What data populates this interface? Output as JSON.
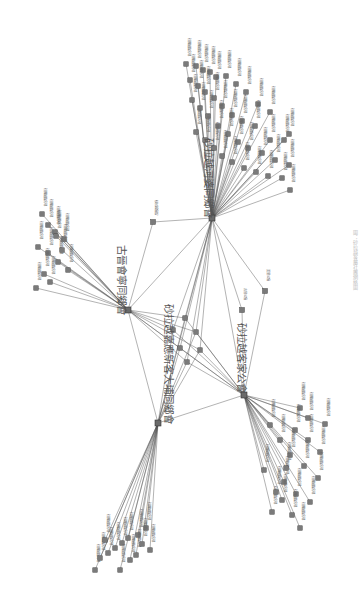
{
  "diagram": {
    "type": "network",
    "orientation": "rotated-90-clockwise",
    "caption": "圖：砂拉越客屬社團網絡圖",
    "hubs": [
      {
        "id": "h1",
        "label": "古晉會寧同鄉會",
        "x": 128,
        "y": 310,
        "label_x": 118,
        "label_y": 318
      },
      {
        "id": "h2",
        "label": "砂拉越河婆同鄉會",
        "x": 212,
        "y": 218,
        "label_x": 205,
        "label_y": 222
      },
      {
        "id": "h3",
        "label": "砂拉越客家公會",
        "x": 244,
        "y": 395,
        "label_x": 238,
        "label_y": 396
      },
      {
        "id": "h4",
        "label": "砂拉越嘉應新客大埔同鄉會",
        "x": 158,
        "y": 423,
        "label_x": 165,
        "label_y": 430
      }
    ],
    "center_nodes": [
      {
        "x": 185,
        "y": 318
      },
      {
        "x": 173,
        "y": 330
      },
      {
        "x": 196,
        "y": 332
      },
      {
        "x": 180,
        "y": 348
      },
      {
        "x": 200,
        "y": 350
      },
      {
        "x": 187,
        "y": 362
      }
    ],
    "bridge_nodes": [
      {
        "x": 153,
        "y": 222,
        "label": "砂拉越會館"
      },
      {
        "x": 242,
        "y": 310,
        "label": "古晉公會"
      },
      {
        "x": 265,
        "y": 291,
        "label": "美里公會"
      }
    ],
    "clusters": {
      "h2": [
        [
          186,
          64
        ],
        [
          196,
          66
        ],
        [
          203,
          70
        ],
        [
          210,
          72
        ],
        [
          216,
          77
        ],
        [
          226,
          76
        ],
        [
          236,
          84
        ],
        [
          246,
          92
        ],
        [
          258,
          104
        ],
        [
          270,
          112
        ],
        [
          289,
          134
        ],
        [
          190,
          80
        ],
        [
          198,
          86
        ],
        [
          205,
          92
        ],
        [
          214,
          98
        ],
        [
          222,
          106
        ],
        [
          232,
          115
        ],
        [
          242,
          121
        ],
        [
          255,
          126
        ],
        [
          270,
          140
        ],
        [
          284,
          140
        ],
        [
          192,
          100
        ],
        [
          200,
          108
        ],
        [
          208,
          116
        ],
        [
          218,
          126
        ],
        [
          228,
          134
        ],
        [
          238,
          142
        ],
        [
          248,
          148
        ],
        [
          262,
          153
        ],
        [
          275,
          160
        ],
        [
          289,
          165
        ],
        [
          196,
          132
        ],
        [
          205,
          140
        ],
        [
          214,
          148
        ],
        [
          222,
          156
        ],
        [
          232,
          162
        ],
        [
          244,
          168
        ],
        [
          256,
          172
        ],
        [
          268,
          176
        ],
        [
          282,
          178
        ],
        [
          290,
          190
        ]
      ],
      "h1": [
        [
          42,
          214
        ],
        [
          48,
          225
        ],
        [
          55,
          232
        ],
        [
          64,
          239
        ],
        [
          38,
          247
        ],
        [
          48,
          253
        ],
        [
          58,
          262
        ],
        [
          68,
          270
        ],
        [
          44,
          274
        ],
        [
          50,
          282
        ],
        [
          36,
          288
        ],
        [
          56,
          236
        ],
        [
          62,
          250
        ]
      ],
      "h4": [
        [
          95,
          570
        ],
        [
          100,
          558
        ],
        [
          108,
          553
        ],
        [
          115,
          548
        ],
        [
          122,
          543
        ],
        [
          128,
          538
        ],
        [
          138,
          535
        ],
        [
          146,
          528
        ],
        [
          150,
          550
        ],
        [
          130,
          560
        ],
        [
          120,
          570
        ],
        [
          136,
          555
        ],
        [
          105,
          540
        ],
        [
          142,
          544
        ]
      ],
      "h3": [
        [
          300,
          408
        ],
        [
          308,
          418
        ],
        [
          325,
          424
        ],
        [
          295,
          430
        ],
        [
          308,
          440
        ],
        [
          320,
          452
        ],
        [
          290,
          455
        ],
        [
          304,
          466
        ],
        [
          318,
          478
        ],
        [
          284,
          482
        ],
        [
          296,
          494
        ],
        [
          310,
          502
        ],
        [
          292,
          515
        ],
        [
          300,
          528
        ],
        [
          282,
          500
        ],
        [
          272,
          512
        ],
        [
          286,
          468
        ],
        [
          280,
          440
        ],
        [
          270,
          425
        ],
        [
          264,
          470
        ],
        [
          276,
          492
        ]
      ]
    },
    "hub_links": [
      [
        "h1",
        "h2"
      ],
      [
        "h1",
        "h3"
      ],
      [
        "h1",
        "h4"
      ],
      [
        "h2",
        "h3"
      ],
      [
        "h2",
        "h4"
      ],
      [
        "h3",
        "h4"
      ]
    ],
    "colors": {
      "edge": "#555555",
      "node": "#7a7a7a",
      "hub": "#6a6a6a",
      "text": "#555555",
      "background": "#ffffff"
    }
  }
}
